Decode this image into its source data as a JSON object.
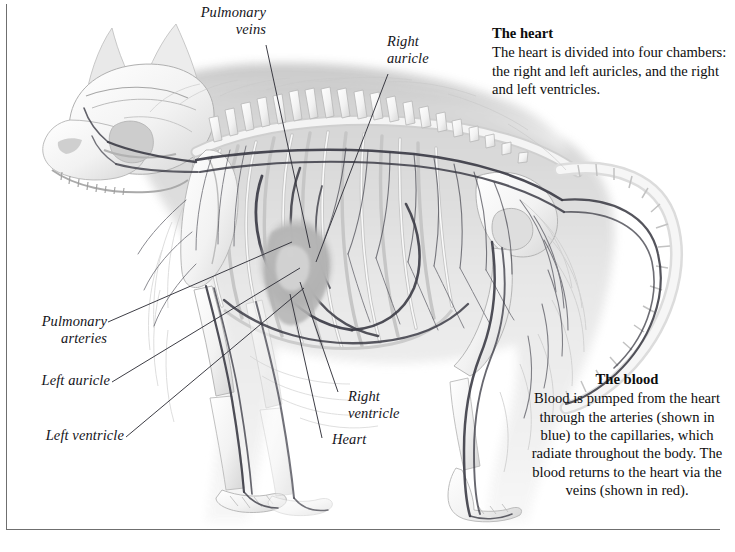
{
  "figure": {
    "background_color": "#ffffff",
    "frame_color": "#6f6f6f",
    "ink_color": "#14141a"
  },
  "labels": [
    {
      "id": "pulmonary-veins",
      "text": "Pulmonary\nveins",
      "align": "right"
    },
    {
      "id": "right-auricle",
      "text": "Right\nauricle",
      "align": "left"
    },
    {
      "id": "pulmonary-arteries",
      "text": "Pulmonary\narteries",
      "align": "right"
    },
    {
      "id": "left-auricle",
      "text": "Left auricle",
      "align": "right"
    },
    {
      "id": "left-ventricle",
      "text": "Left ventricle",
      "align": "right"
    },
    {
      "id": "right-ventricle",
      "text": "Right\nventricle",
      "align": "left"
    },
    {
      "id": "heart",
      "text": "Heart",
      "align": "left"
    }
  ],
  "notes": {
    "heart": {
      "title": "The heart",
      "body": "The heart is divided into four chambers: the right and left auricles, and the right and left ventricles."
    },
    "blood": {
      "title": "The blood",
      "body": "Blood is pumped from the heart through the arteries (shown in blue) to the capillaries, which radiate throughout the body. The blood returns to the heart via the veins (shown in red)."
    }
  }
}
